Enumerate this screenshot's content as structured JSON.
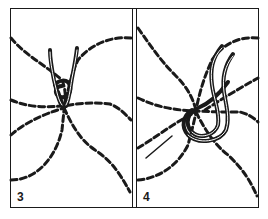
{
  "figure": {
    "colors": {
      "ink": "#1a1a1a",
      "background": "#ffffff"
    },
    "panels": [
      {
        "id": "step-3",
        "label": "3"
      },
      {
        "id": "step-4",
        "label": "4"
      }
    ]
  }
}
